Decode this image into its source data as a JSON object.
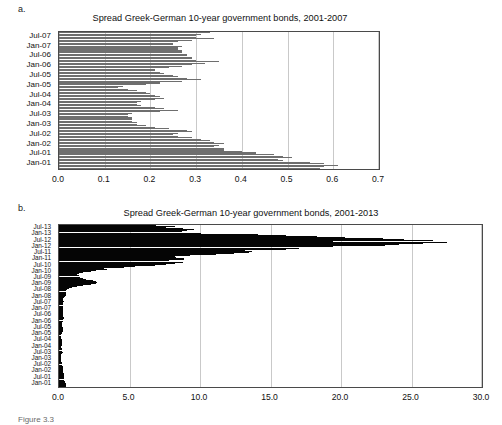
{
  "figure": {
    "caption": "Figure 3.3"
  },
  "panels": [
    {
      "panel_label": "a.",
      "title": "Spread Greek-German 10-year government bonds, 2001-2007"
    },
    {
      "panel_label": "b.",
      "title": "Spread Greek-German 10-year government bonds, 2001-2013"
    }
  ],
  "chart_data": [
    {
      "type": "bar",
      "orientation": "horizontal",
      "title": "Spread Greek-German 10-year government bonds, 2001-2007",
      "panel": "a.",
      "xlabel": "",
      "ylabel": "",
      "xlim": [
        0.0,
        0.7
      ],
      "ylim_categories_order": "top = Jul-07 (latest), bottom = Jan-01 (earliest)",
      "grid": true,
      "gridlines_at": [
        0.0,
        0.1,
        0.2,
        0.3,
        0.4,
        0.5,
        0.6,
        0.7
      ],
      "xticklabels": [
        "0.0",
        "0.1",
        "0.2",
        "0.3",
        "0.4",
        "0.5",
        "0.6",
        "0.7"
      ],
      "yticklabels": [
        "Jul-07",
        "Jan-07",
        "Jul-06",
        "Jan-06",
        "Jul-05",
        "Jan-05",
        "Jul-04",
        "Jan-04",
        "Jul-03",
        "Jan-03",
        "Jul-02",
        "Jan-02",
        "Jul-01",
        "Jan-01"
      ],
      "bar_color": "#6e6e6e",
      "series": [
        {
          "name": "Spread (percentage points)",
          "categories": [
            "Dec-07",
            "Nov-07",
            "Oct-07",
            "Sep-07",
            "Aug-07",
            "Jul-07",
            "Jun-07",
            "May-07",
            "Apr-07",
            "Mar-07",
            "Feb-07",
            "Jan-07",
            "Dec-06",
            "Nov-06",
            "Oct-06",
            "Sep-06",
            "Aug-06",
            "Jul-06",
            "Jun-06",
            "May-06",
            "Apr-06",
            "Mar-06",
            "Feb-06",
            "Jan-06",
            "Dec-05",
            "Nov-05",
            "Oct-05",
            "Sep-05",
            "Aug-05",
            "Jul-05",
            "Jun-05",
            "May-05",
            "Apr-05",
            "Mar-05",
            "Feb-05",
            "Jan-05",
            "Dec-04",
            "Nov-04",
            "Oct-04",
            "Sep-04",
            "Aug-04",
            "Jul-04",
            "Jun-04",
            "May-04",
            "Apr-04",
            "Mar-04",
            "Feb-04",
            "Jan-04",
            "Dec-03",
            "Nov-03",
            "Oct-03",
            "Sep-03",
            "Aug-03",
            "Jul-03",
            "Jun-03",
            "May-03",
            "Apr-03",
            "Mar-03",
            "Feb-03",
            "Jan-03",
            "Dec-02",
            "Nov-02",
            "Oct-02",
            "Sep-02",
            "Aug-02",
            "Jul-02",
            "Jun-02",
            "May-02",
            "Apr-02",
            "Mar-02",
            "Feb-02",
            "Jan-02",
            "Dec-01",
            "Nov-01",
            "Oct-01",
            "Sep-01",
            "Aug-01",
            "Jul-01",
            "Jun-01",
            "May-01",
            "Apr-01",
            "Mar-01",
            "Feb-01",
            "Jan-01"
          ],
          "values": [
            0.33,
            0.31,
            0.3,
            0.3,
            0.34,
            0.29,
            0.26,
            0.25,
            0.25,
            0.27,
            0.26,
            0.26,
            0.27,
            0.27,
            0.28,
            0.28,
            0.29,
            0.29,
            0.3,
            0.35,
            0.32,
            0.29,
            0.27,
            0.24,
            0.21,
            0.21,
            0.22,
            0.23,
            0.25,
            0.26,
            0.28,
            0.31,
            0.27,
            0.22,
            0.19,
            0.14,
            0.13,
            0.15,
            0.17,
            0.19,
            0.2,
            0.21,
            0.22,
            0.23,
            0.21,
            0.18,
            0.17,
            0.17,
            0.18,
            0.21,
            0.23,
            0.26,
            0.22,
            0.16,
            0.15,
            0.15,
            0.16,
            0.16,
            0.16,
            0.17,
            0.17,
            0.19,
            0.21,
            0.24,
            0.28,
            0.29,
            0.26,
            0.25,
            0.26,
            0.29,
            0.31,
            0.33,
            0.34,
            0.36,
            0.35,
            0.34,
            0.36,
            0.36,
            0.4,
            0.43,
            0.47,
            0.49,
            0.51,
            0.48,
            0.49,
            0.55,
            0.58,
            0.61,
            0.58,
            0.57
          ]
        }
      ]
    },
    {
      "type": "bar",
      "orientation": "horizontal",
      "title": "Spread Greek-German 10-year government bonds, 2001-2013",
      "panel": "b.",
      "xlabel": "",
      "ylabel": "",
      "xlim": [
        0.0,
        30.0
      ],
      "ylim_categories_order": "top = Jul-13 (latest), bottom = Jan-01 (earliest)",
      "grid": true,
      "gridlines_at": [
        0.0,
        5.0,
        10.0,
        15.0,
        20.0,
        25.0,
        30.0
      ],
      "xticklabels": [
        "0.0",
        "5.0",
        "10.0",
        "15.0",
        "20.0",
        "25.0",
        "30.0"
      ],
      "yticklabels": [
        "Jul-13",
        "Jan-13",
        "Jul-12",
        "Jan-12",
        "Jul-11",
        "Jan-11",
        "Jul-10",
        "Jan-10",
        "Jul-09",
        "Jan-09",
        "Jul-08",
        "Jan-08",
        "Jul-07",
        "Jan-07",
        "Jul-06",
        "Jan-06",
        "Jul-05",
        "Jan-05",
        "Jul-04",
        "Jan-04",
        "Jul-03",
        "Jan-03",
        "Jul-02",
        "Jan-02",
        "Jul-01",
        "Jan-01"
      ],
      "bar_color": "#050505",
      "series": [
        {
          "name": "Spread (percentage points)",
          "categories": [
            "Jul-13",
            "Jun-13",
            "May-13",
            "Apr-13",
            "Mar-13",
            "Feb-13",
            "Jan-13",
            "Dec-12",
            "Nov-12",
            "Oct-12",
            "Sep-12",
            "Aug-12",
            "Jul-12",
            "Jun-12",
            "May-12",
            "Apr-12",
            "Mar-12",
            "Feb-12",
            "Jan-12",
            "Dec-11",
            "Nov-11",
            "Oct-11",
            "Sep-11",
            "Aug-11",
            "Jul-11",
            "Jun-11",
            "May-11",
            "Apr-11",
            "Mar-11",
            "Feb-11",
            "Jan-11",
            "Dec-10",
            "Nov-10",
            "Oct-10",
            "Sep-10",
            "Aug-10",
            "Jul-10",
            "Jun-10",
            "May-10",
            "Apr-10",
            "Mar-10",
            "Feb-10",
            "Jan-10",
            "Dec-09",
            "Nov-09",
            "Oct-09",
            "Sep-09",
            "Aug-09",
            "Jul-09",
            "Jun-09",
            "May-09",
            "Apr-09",
            "Mar-09",
            "Feb-09",
            "Jan-09",
            "Dec-08",
            "Nov-08",
            "Oct-08",
            "Sep-08",
            "Aug-08",
            "Jul-08",
            "Jun-08",
            "May-08",
            "Apr-08",
            "Mar-08",
            "Feb-08",
            "Jan-08",
            "Dec-07",
            "Nov-07",
            "Oct-07",
            "Sep-07",
            "Aug-07",
            "Jul-07",
            "Jun-07",
            "May-07",
            "Apr-07",
            "Mar-07",
            "Feb-07",
            "Jan-07",
            "Dec-06",
            "Nov-06",
            "Oct-06",
            "Sep-06",
            "Aug-06",
            "Jul-06",
            "Jun-06",
            "May-06",
            "Apr-06",
            "Mar-06",
            "Feb-06",
            "Jan-06",
            "Dec-05",
            "Nov-05",
            "Oct-05",
            "Sep-05",
            "Aug-05",
            "Jul-05",
            "Jun-05",
            "May-05",
            "Apr-05",
            "Mar-05",
            "Feb-05",
            "Jan-05",
            "Dec-04",
            "Nov-04",
            "Oct-04",
            "Sep-04",
            "Aug-04",
            "Jul-04",
            "Jun-04",
            "May-04",
            "Apr-04",
            "Mar-04",
            "Feb-04",
            "Jan-04",
            "Dec-03",
            "Nov-03",
            "Oct-03",
            "Sep-03",
            "Aug-03",
            "Jul-03",
            "Jun-03",
            "May-03",
            "Apr-03",
            "Mar-03",
            "Feb-03",
            "Jan-03",
            "Dec-02",
            "Nov-02",
            "Oct-02",
            "Sep-02",
            "Aug-02",
            "Jul-02",
            "Jun-02",
            "May-02",
            "Apr-02",
            "Mar-02",
            "Feb-02",
            "Jan-02",
            "Dec-01",
            "Nov-01",
            "Oct-01",
            "Sep-01",
            "Aug-01",
            "Jul-01",
            "Jun-01",
            "May-01",
            "Apr-01",
            "Mar-01",
            "Feb-01",
            "Jan-01"
          ],
          "values": [
            6.9,
            8.2,
            7.6,
            8.8,
            9.6,
            9.1,
            8.7,
            10.1,
            14.1,
            16.1,
            18.3,
            20.3,
            23.0,
            24.5,
            26.5,
            19.4,
            27.5,
            25.8,
            24.1,
            23.1,
            19.4,
            17.0,
            16.1,
            13.2,
            13.7,
            13.5,
            12.4,
            11.1,
            9.3,
            8.2,
            8.3,
            8.9,
            8.9,
            7.8,
            8.8,
            8.2,
            7.6,
            6.8,
            5.4,
            4.6,
            3.2,
            3.4,
            2.6,
            2.3,
            1.7,
            1.4,
            1.3,
            1.4,
            1.5,
            1.7,
            1.9,
            2.4,
            2.6,
            2.7,
            2.6,
            2.3,
            1.7,
            1.3,
            0.9,
            0.7,
            0.6,
            0.5,
            0.5,
            0.5,
            0.5,
            0.5,
            0.4,
            0.33,
            0.31,
            0.3,
            0.3,
            0.34,
            0.29,
            0.26,
            0.25,
            0.25,
            0.27,
            0.26,
            0.26,
            0.27,
            0.27,
            0.28,
            0.28,
            0.29,
            0.29,
            0.3,
            0.35,
            0.32,
            0.29,
            0.27,
            0.24,
            0.21,
            0.21,
            0.22,
            0.23,
            0.25,
            0.26,
            0.28,
            0.31,
            0.27,
            0.22,
            0.19,
            0.14,
            0.13,
            0.15,
            0.17,
            0.19,
            0.2,
            0.21,
            0.22,
            0.23,
            0.21,
            0.18,
            0.17,
            0.17,
            0.18,
            0.21,
            0.23,
            0.26,
            0.22,
            0.16,
            0.15,
            0.15,
            0.16,
            0.16,
            0.16,
            0.17,
            0.17,
            0.19,
            0.21,
            0.24,
            0.28,
            0.29,
            0.26,
            0.25,
            0.26,
            0.29,
            0.31,
            0.33,
            0.34,
            0.36,
            0.35,
            0.34,
            0.36,
            0.36,
            0.4,
            0.43,
            0.47,
            0.49,
            0.51,
            0.48
          ]
        }
      ]
    }
  ]
}
